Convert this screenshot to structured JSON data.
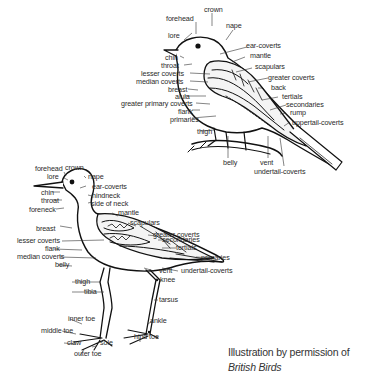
{
  "figure": {
    "type": "bird topography diagram",
    "credit_line": "Illustration by permission of",
    "credit_source": "British Birds"
  },
  "perched_bird": {
    "labels": {
      "forehead": "forehead",
      "crown": "crown",
      "nape": "nape",
      "lore": "lore",
      "ear_coverts": "ear-coverts",
      "mantle": "mantle",
      "chin": "chin",
      "throat": "throat",
      "scapulars": "scapulars",
      "lesser_coverts": "lesser coverts",
      "greater_coverts": "greater coverts",
      "median_coverts": "median coverts",
      "back": "back",
      "breast": "breast",
      "tertials": "tertials",
      "alula": "alula",
      "secondaries": "secondaries",
      "greater_primary_coverts": "greater primary coverts",
      "rump": "rump",
      "flank": "flank",
      "uppertail_coverts": "uppertail-coverts",
      "primaries": "primaries",
      "thigh": "thigh",
      "belly": "belly",
      "vent": "vent",
      "undertail_coverts": "undertail-coverts"
    }
  },
  "wader": {
    "labels": {
      "forehead": "forehead",
      "crown": "crown",
      "lore": "lore",
      "nape": "nape",
      "ear_coverts": "ear-coverts",
      "chin": "chin",
      "hindneck": "hindneck",
      "throat": "throat",
      "side_of_neck": "side of neck",
      "foreneck": "foreneck",
      "mantle": "mantle",
      "scapulars": "scapulars",
      "breast": "breast",
      "greater_coverts": "greater coverts",
      "secondaries": "secondaries",
      "lesser_coverts": "lesser coverts",
      "tertials": "tertials",
      "flank": "flank",
      "primaries": "primaries",
      "median_coverts": "median coverts",
      "belly": "belly",
      "vent": "vent",
      "undertail_coverts": "undertail-coverts",
      "thigh": "thigh",
      "knee": "knee",
      "tibia": "tibia",
      "tarsus": "tarsus",
      "inner_toe": "inner toe",
      "ankle": "ankle",
      "middle_toe": "middle toe",
      "hind_toe": "hind toe",
      "claw": "claw",
      "sole": "sole",
      "outer_toe": "outer toe"
    }
  }
}
